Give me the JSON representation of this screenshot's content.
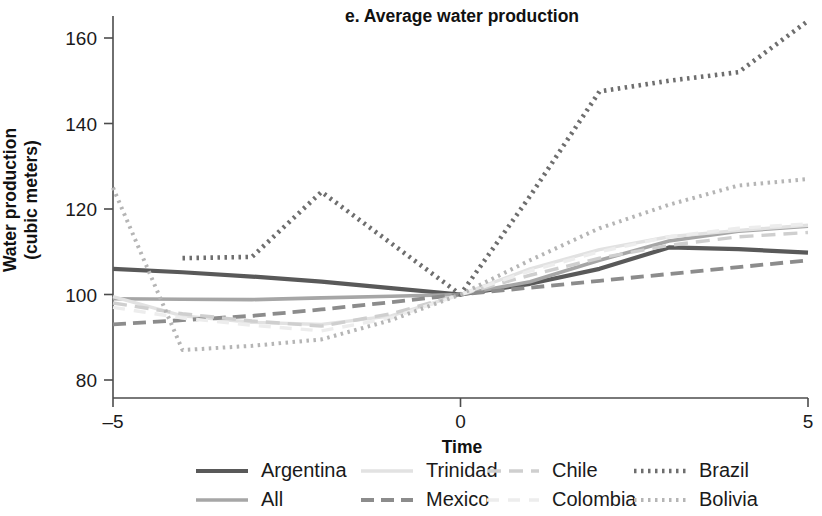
{
  "chart_data": {
    "type": "line",
    "title": "e. Average water production",
    "xlabel": "Time",
    "ylabel": "Water production\n(cubic meters)",
    "ylabel_line1": "Water production",
    "ylabel_line2": "(cubic meters)",
    "x": [
      -5,
      -4,
      -3,
      -2,
      -1,
      0,
      1,
      2,
      3,
      4,
      5
    ],
    "xlim": [
      -5,
      5
    ],
    "ylim": [
      76,
      167
    ],
    "xticks": [
      -5,
      0,
      5
    ],
    "xticklabels": [
      "–5",
      "0",
      "5"
    ],
    "yticks": [
      80,
      100,
      120,
      140,
      160
    ],
    "yticklabels": [
      "80",
      "100",
      "120",
      "140",
      "160"
    ],
    "grid": false,
    "legend_position": "bottom",
    "series": [
      {
        "name": "Argentina",
        "color": "#595959",
        "width": 4.2,
        "dash": "",
        "x": [
          -5,
          -4,
          -3,
          -2,
          -1,
          0,
          1,
          2,
          3,
          4,
          5
        ],
        "values": [
          106,
          105.2,
          104.2,
          103,
          101.5,
          100,
          102.5,
          106,
          111,
          110.6,
          109.8
        ]
      },
      {
        "name": "All",
        "color": "#a6a6a6",
        "width": 3.6,
        "dash": "",
        "x": [
          -5,
          -4,
          -3,
          -2,
          -1,
          0,
          1,
          2,
          3,
          4,
          5
        ],
        "values": [
          99,
          98.9,
          98.8,
          99.2,
          99.6,
          100,
          103,
          108,
          112.5,
          114.8,
          116
        ]
      },
      {
        "name": "Trinidad",
        "color": "#e2e2e2",
        "width": 3.4,
        "dash": "",
        "x": [
          -5,
          -4,
          -3,
          -2,
          -1,
          0,
          1,
          2,
          3,
          4,
          5
        ],
        "values": [
          99.5,
          95,
          93.5,
          93,
          95,
          100,
          106,
          110.5,
          113.5,
          115,
          116.2
        ]
      },
      {
        "name": "Mexico",
        "color": "#8c8c8c",
        "width": 3.8,
        "dash": "13 7 13 7",
        "x": [
          -5,
          -4,
          -3,
          -2,
          -1,
          0,
          1,
          2,
          3,
          4,
          5
        ],
        "values": [
          93,
          94,
          95,
          96.5,
          98.2,
          100,
          101.6,
          103.2,
          104.8,
          106.4,
          108
        ]
      },
      {
        "name": "Chile",
        "color": "#cfcfcf",
        "width": 3.4,
        "dash": "14 8",
        "x": [
          -5,
          -4,
          -3,
          -2,
          -1,
          0,
          1,
          2,
          3,
          4,
          5
        ],
        "values": [
          98,
          95.5,
          93.8,
          92.6,
          95.5,
          100,
          104.5,
          108.5,
          111.5,
          113.5,
          114.5
        ]
      },
      {
        "name": "Colombia",
        "color": "#ededed",
        "width": 3.4,
        "dash": "12 9",
        "x": [
          -5,
          -4,
          -3,
          -2,
          -1,
          0,
          1,
          2,
          3,
          4,
          5
        ],
        "values": [
          97,
          94.5,
          92.8,
          91.5,
          94.5,
          100,
          105.5,
          110,
          113.5,
          115.5,
          116.5
        ]
      },
      {
        "name": "Brazil",
        "color": "#6e6e6e",
        "width": 4.6,
        "dash": "2.5 4.5",
        "x": [
          -4,
          -3,
          -2,
          -1,
          0,
          1,
          2,
          3,
          4,
          5
        ],
        "values": [
          108.5,
          108.8,
          124,
          112,
          100,
          123,
          147.5,
          150,
          152,
          164
        ]
      },
      {
        "name": "Bolivia",
        "color": "#b5b5b5",
        "width": 4.0,
        "dash": "2.5 4.5",
        "x": [
          -5,
          -4,
          -3,
          -2,
          -1,
          0,
          1,
          2,
          3,
          4,
          5
        ],
        "values": [
          125,
          87,
          88,
          89.5,
          94,
          100,
          108,
          115.5,
          121,
          125.5,
          127
        ]
      }
    ]
  },
  "legend": {
    "rows": [
      [
        {
          "label": "Argentina",
          "series": "Argentina"
        },
        {
          "label": "Trinidad",
          "series": "Trinidad"
        },
        {
          "label": "Chile",
          "series": "Chile"
        },
        {
          "label": "Brazil",
          "series": "Brazil"
        }
      ],
      [
        {
          "label": "All",
          "series": "All"
        },
        {
          "label": "Mexico",
          "series": "Mexico"
        },
        {
          "label": "Colombia",
          "series": "Colombia"
        },
        {
          "label": "Bolivia",
          "series": "Bolivia"
        }
      ]
    ]
  }
}
